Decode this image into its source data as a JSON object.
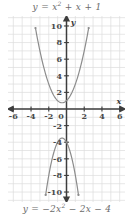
{
  "figure": {
    "name": "two-parabolas-graph",
    "background_color": "#ffffff",
    "grid_color": "#dcdcdc",
    "axis_color": "#3d3d3d",
    "curve_color": "#8c8c8c",
    "label_color": "#6b6b6b",
    "tick_label_color": "#4a4a4a"
  },
  "labels": {
    "top_equation": "y = x2 + x + 1",
    "top_equation_parts": {
      "lhs": "y",
      "eq": "=",
      "term1": "x",
      "exp1": "2",
      "rest": "+ x + 1"
    },
    "bottom_equation": "y = −2x2 − 2x − 4",
    "bottom_equation_parts": {
      "lhs": "y",
      "eq": "=",
      "coef": "−2",
      "term1": "x",
      "exp1": "2",
      "rest": "− 2x − 4"
    },
    "x_axis_name": "x",
    "y_axis_name": "y"
  },
  "axes": {
    "x_ticks": [
      "-6",
      "-4",
      "-2",
      "2",
      "4",
      "6"
    ],
    "x_tick_values": [
      -6,
      -4,
      -2,
      2,
      4,
      6
    ],
    "origin_label": "0",
    "y_ticks": [
      "10",
      "8",
      "6",
      "4",
      "2",
      "-2",
      "-4",
      "-6",
      "-8",
      "-10"
    ],
    "y_tick_values": [
      10,
      8,
      6,
      4,
      2,
      -2,
      -4,
      -6,
      -8,
      -10
    ],
    "xlim": [
      -6.6,
      6.6
    ],
    "ylim": [
      -11.2,
      11.2
    ],
    "grid_step": 1,
    "grid": true,
    "arrows": [
      "left",
      "right",
      "up",
      "down"
    ]
  },
  "chart_data": {
    "type": "line",
    "title": "",
    "xlabel": "x",
    "ylabel": "y",
    "xlim": [
      -6.6,
      6.6
    ],
    "ylim": [
      -11.2,
      11.2
    ],
    "grid": true,
    "legend": "none",
    "series": [
      {
        "name": "y = x2 + x + 1",
        "equation": "y = x^2 + x + 1",
        "coefficients": {
          "a": 1,
          "b": 1,
          "c": 1
        },
        "vertex": [
          -0.5,
          0.75
        ],
        "opens": "up",
        "x_domain": [
          -3.5,
          2.5
        ],
        "y_range": [
          0.75,
          10.75
        ],
        "endpoint_markers": true,
        "color": "#8c8c8c"
      },
      {
        "name": "y = -2x2 - 2x - 4",
        "equation": "y = -2x^2 - 2x - 4",
        "coefficients": {
          "a": -2,
          "b": -2,
          "c": -4
        },
        "vertex": [
          -0.5,
          -3.5
        ],
        "opens": "down",
        "x_domain": [
          -2.35,
          1.35
        ],
        "y_range": [
          -10.8,
          -3.5
        ],
        "endpoint_markers": true,
        "color": "#8c8c8c"
      }
    ]
  }
}
